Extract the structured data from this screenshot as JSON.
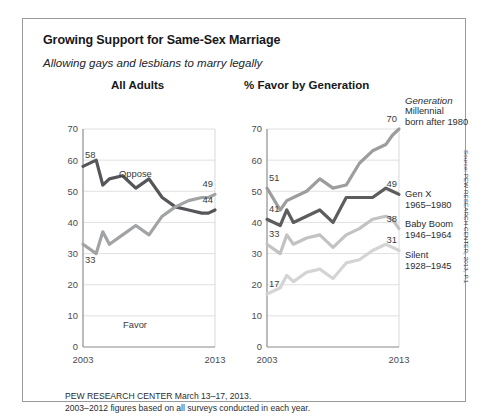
{
  "card": {
    "title": "Growing Support for Same-Sex Marriage",
    "subtitle": "Allowing gays and lesbians to marry legally"
  },
  "panels": {
    "left_heading": "All Adults",
    "right_heading": "% Favor by Generation"
  },
  "legend": {
    "heading": "Generation",
    "items": [
      {
        "name": "Millennial",
        "years": "born after 1980",
        "color": "#9d9d9d",
        "end_value": 70
      },
      {
        "name": "Gen X",
        "years": "1965–1980",
        "color": "#5d5d5d",
        "end_value": 49
      },
      {
        "name": "Baby Boom",
        "years": "1946–1964",
        "color": "#c2c2c2",
        "end_value": 38
      },
      {
        "name": "Silent",
        "years": "1928–1945",
        "color": "#d4d4d4",
        "end_value": 31
      }
    ]
  },
  "footnote": {
    "line1": "PEW RESEARCH CENTER March 13–17, 2013.",
    "line2": "2003–2012 figures based on all surveys conducted in each year."
  },
  "source": "Source: PEW RESEARCH CENTER, 2013, P.1",
  "chart_data": [
    {
      "type": "line",
      "title": "All Adults",
      "xlabel": "",
      "ylabel": "",
      "ylim": [
        0,
        70
      ],
      "yticks": [
        0,
        10,
        20,
        30,
        40,
        50,
        60,
        70
      ],
      "xlim": [
        2003,
        2013
      ],
      "xticks": [
        2003,
        2013
      ],
      "xticklabels": [
        "2003",
        "2013"
      ],
      "grid": true,
      "legend_position": "inline-annotation",
      "x": [
        2003,
        2004,
        2004.5,
        2005,
        2006,
        2007,
        2008,
        2009,
        2010,
        2011,
        2012,
        2012.5,
        2013
      ],
      "series": [
        {
          "name": "Oppose",
          "color": "#55565a",
          "values": [
            58,
            60,
            52,
            54,
            55,
            51,
            54,
            48,
            45,
            44,
            43,
            43,
            44
          ],
          "start_label": 58,
          "end_label": 44
        },
        {
          "name": "Favor",
          "color": "#a2a3a5",
          "values": [
            33,
            30,
            37,
            33,
            36,
            39,
            36,
            42,
            45,
            47,
            48,
            48,
            49
          ],
          "start_label": 33,
          "end_label": 49
        }
      ]
    },
    {
      "type": "line",
      "title": "% Favor by Generation",
      "xlabel": "",
      "ylabel": "",
      "ylim": [
        0,
        70
      ],
      "yticks": [
        0,
        10,
        20,
        30,
        40,
        50,
        60,
        70
      ],
      "xlim": [
        2003,
        2013
      ],
      "xticks": [
        2003,
        2013
      ],
      "xticklabels": [
        "2003",
        "2013"
      ],
      "grid": true,
      "legend_position": "right",
      "x": [
        2003,
        2004,
        2004.5,
        2005,
        2006,
        2007,
        2008,
        2009,
        2010,
        2011,
        2012,
        2012.5,
        2013
      ],
      "series": [
        {
          "name": "Millennial",
          "color": "#9d9d9d",
          "values": [
            51,
            44,
            47,
            48,
            50,
            54,
            51,
            52,
            59,
            63,
            65,
            68,
            70
          ],
          "start_label": 51,
          "end_label": 70
        },
        {
          "name": "Gen X",
          "color": "#5d5d5d",
          "values": [
            41,
            39,
            44,
            40,
            42,
            44,
            40,
            48,
            48,
            48,
            51,
            50,
            49
          ],
          "start_label": 41,
          "end_label": 49
        },
        {
          "name": "Baby Boom",
          "color": "#c2c2c2",
          "values": [
            33,
            30,
            36,
            33,
            35,
            36,
            32,
            36,
            38,
            41,
            42,
            41,
            38
          ],
          "start_label": 33,
          "end_label": 38
        },
        {
          "name": "Silent",
          "color": "#d4d4d4",
          "values": [
            17,
            19,
            23,
            21,
            24,
            25,
            22,
            27,
            28,
            31,
            33,
            32,
            31
          ],
          "start_label": 17,
          "end_label": 31
        }
      ]
    }
  ]
}
